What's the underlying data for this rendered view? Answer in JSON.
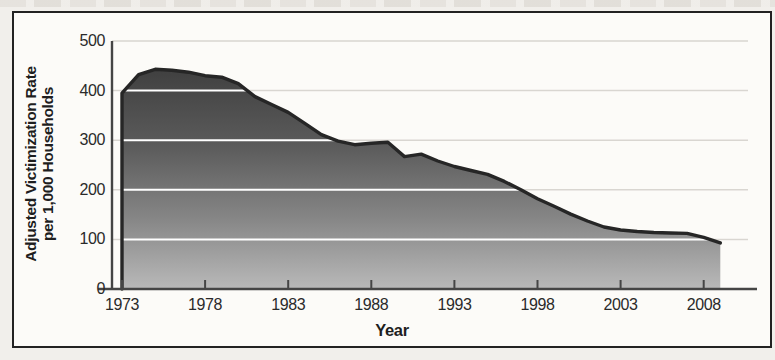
{
  "figure": {
    "y_axis_title_line1": "Adjusted Victimization Rate",
    "y_axis_title_line2": "per 1,000 Households",
    "x_axis_title": "Year"
  },
  "chart_data": {
    "type": "area",
    "title": "",
    "xlabel": "Year",
    "ylabel": "Adjusted Victimization Rate per 1,000 Households",
    "x": [
      1973,
      1974,
      1975,
      1976,
      1977,
      1978,
      1979,
      1980,
      1981,
      1982,
      1983,
      1984,
      1985,
      1986,
      1987,
      1988,
      1989,
      1990,
      1991,
      1992,
      1993,
      1994,
      1995,
      1996,
      1997,
      1998,
      1999,
      2000,
      2001,
      2002,
      2003,
      2004,
      2005,
      2006,
      2007,
      2008,
      2009
    ],
    "values": [
      395,
      432,
      443,
      441,
      437,
      430,
      427,
      414,
      388,
      372,
      356,
      334,
      311,
      298,
      291,
      294,
      296,
      267,
      272,
      258,
      247,
      239,
      231,
      217,
      200,
      182,
      167,
      151,
      137,
      125,
      119,
      116,
      114,
      113,
      112,
      104,
      93
    ],
    "xticks": [
      1973,
      1978,
      1983,
      1988,
      1993,
      1998,
      2003,
      2008
    ],
    "yticks": [
      0,
      100,
      200,
      300,
      400,
      500
    ],
    "xlim": [
      1973,
      2009.5
    ],
    "ylim": [
      0,
      500
    ],
    "grid": "horizontal-only",
    "legend": "none",
    "colors": {
      "area_top": "#404040",
      "area_mid": "#868686",
      "area_bottom": "#b9b9b9",
      "line": "#262626",
      "grid_light": "#d9d6d1",
      "grid_on_area": "#ffffff",
      "axis": "#454545",
      "text": "#262626",
      "frame": "#222222",
      "paper": "#fcfbf8"
    }
  }
}
